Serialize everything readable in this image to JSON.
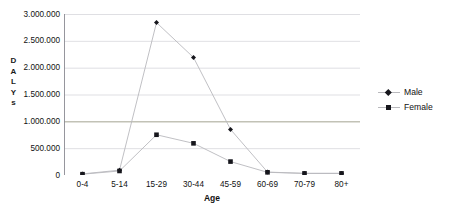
{
  "chart_data": {
    "type": "line",
    "title": "",
    "xlabel": "Age",
    "ylabel": "DALYs",
    "ylabel_chars": [
      "D",
      "A",
      "L",
      "Y",
      "s"
    ],
    "categories": [
      "0-4",
      "5-14",
      "15-29",
      "30-44",
      "45-59",
      "60-69",
      "70-79",
      "80+"
    ],
    "ylim": [
      0,
      3000000
    ],
    "ytick_labels": [
      "3.000.000",
      "2.500.000",
      "2.000.000",
      "1.500.000",
      "1.000.000",
      "500.000",
      "0"
    ],
    "ytick_values": [
      3000000,
      2500000,
      2000000,
      1500000,
      1000000,
      500000,
      0
    ],
    "grid": "horizontal",
    "legend_position": "right",
    "series": [
      {
        "name": "Male",
        "marker": "diamond",
        "color": "#16161c",
        "line_color": "#b9b9bd",
        "values": [
          20000,
          90000,
          2840000,
          2190000,
          850000,
          55000,
          30000,
          30000
        ]
      },
      {
        "name": "Female",
        "marker": "square",
        "color": "#16161c",
        "line_color": "#b9b9bd",
        "values": [
          15000,
          75000,
          750000,
          590000,
          250000,
          50000,
          30000,
          30000
        ]
      }
    ]
  },
  "legend": {
    "entries": [
      {
        "label": "Male"
      },
      {
        "label": "Female"
      }
    ]
  },
  "colors": {
    "gridline": "#d7d7dc",
    "axis": "#8a8a92",
    "marker": "#16161c",
    "line": "#b9b9bd",
    "text": "#111111",
    "background": "#ffffff"
  }
}
